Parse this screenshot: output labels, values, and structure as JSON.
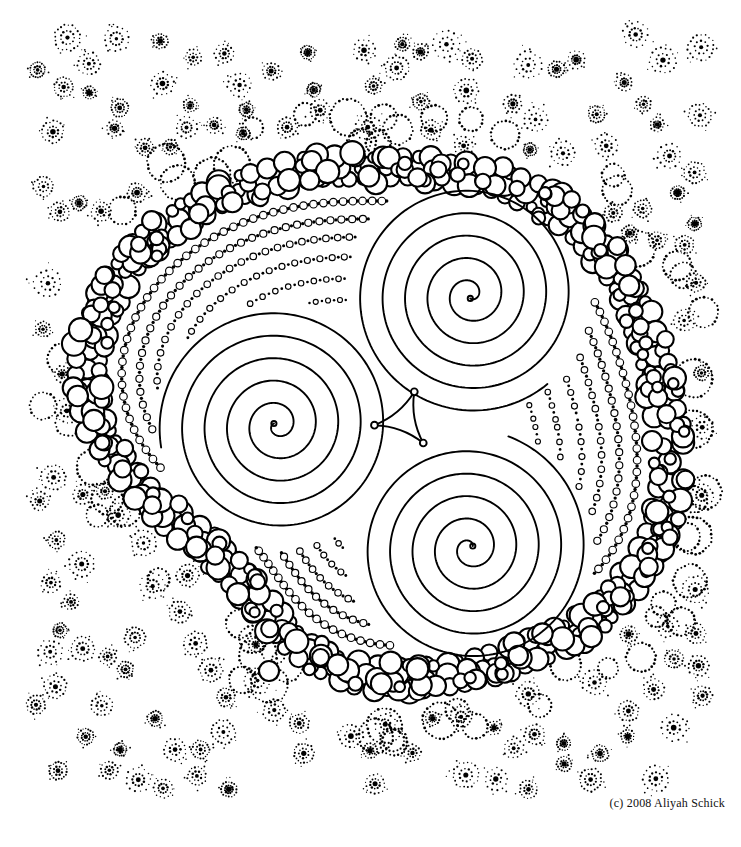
{
  "artwork": {
    "title": "Triple Spiral Mandala",
    "medium": "pen and ink line drawing",
    "palette": {
      "ink": "#000000",
      "paper": "#ffffff"
    },
    "canvas": {
      "width": 741,
      "height": 847
    }
  },
  "credit": {
    "text": "(c) 2008 Aliyah Schick"
  },
  "composition": {
    "center": {
      "x": 378,
      "y": 420
    },
    "spirals": [
      {
        "name": "left-spiral",
        "cx": 277,
        "cy": 425,
        "turns": 5.1,
        "r_outer": 118,
        "rotation": 205
      },
      {
        "name": "top-right-spiral",
        "cx": 470,
        "cy": 295,
        "turns": 5.1,
        "r_outer": 118,
        "rotation": 85
      },
      {
        "name": "bottom-right-spiral",
        "cx": 470,
        "cy": 548,
        "turns": 5.1,
        "r_outer": 118,
        "rotation": 325
      }
    ],
    "triangle_knot": {
      "cx": 404,
      "cy": 420,
      "radius": 30,
      "vertex_dots": 3
    },
    "circle_band": {
      "description": "thick organic chain of touching outlined circles forming the outer ring",
      "rows": 3,
      "circle_radius_min": 5,
      "circle_radius_max": 12,
      "stroke_width": 2.1
    },
    "dotted_arcs": {
      "description": "concentric rings of alternating tiny open circles and solid dots inside the band",
      "ring_count": 6
    },
    "starburst_field": {
      "description": "background field of dotted starburst motifs with dark centers",
      "motif_count": 150
    },
    "loose_circles": [
      {
        "name": "loose-circle-top",
        "cx": 289,
        "cy": 180,
        "r": 11
      },
      {
        "name": "loose-circle-bottom",
        "cx": 269,
        "cy": 671,
        "r": 10
      },
      {
        "name": "loose-circle-right",
        "cx": 652,
        "cy": 441,
        "r": 10
      }
    ]
  },
  "chart_data": {
    "type": "scatter",
    "xlabel": "",
    "ylabel": "",
    "xlim": [
      0,
      741
    ],
    "ylim": [
      0,
      847
    ],
    "grid": false,
    "legend": "none",
    "annotations": [
      "(c) 2008 Aliyah Schick"
    ],
    "series": [
      {
        "name": "left-spiral",
        "cx": 277,
        "cy": 425,
        "turns": 5.1
      },
      {
        "name": "top-right-spiral",
        "cx": 470,
        "cy": 295,
        "turns": 5.1
      },
      {
        "name": "bottom-right-spiral",
        "cx": 470,
        "cy": 548,
        "turns": 5.1
      }
    ]
  }
}
